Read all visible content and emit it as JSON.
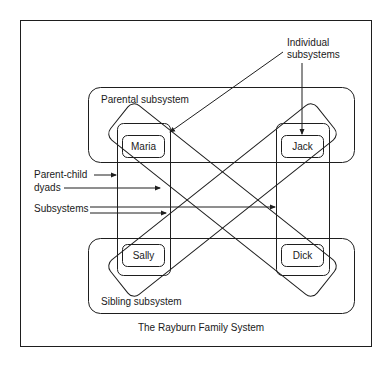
{
  "diagram": {
    "title": "The Rayburn Family System",
    "people": {
      "maria": "Maria",
      "jack": "Jack",
      "sally": "Sally",
      "dick": "Dick"
    },
    "groups": {
      "parental": "Parental subsystem",
      "sibling": "Sibling subsystem"
    },
    "annotations": {
      "individual_line1": "Individual",
      "individual_line2": "subsystems",
      "dyads_line1": "Parent-child",
      "dyads_line2": "dyads",
      "subsystems": "Subsystems"
    },
    "colors": {
      "line": "#1e1e1e",
      "background": "#ffffff"
    }
  }
}
